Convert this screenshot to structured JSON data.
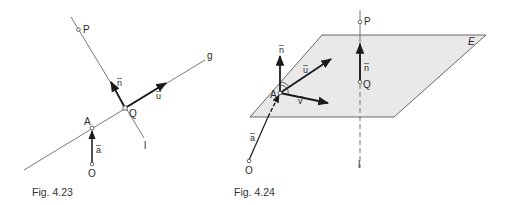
{
  "figures": [
    {
      "caption": "Fig. 4.23",
      "points": {
        "P": "P",
        "Q": "Q",
        "A": "A",
        "O": "O"
      },
      "lines": {
        "g": "g",
        "l": "l"
      },
      "vectors": {
        "n": "n",
        "u": "u",
        "a": "a"
      }
    },
    {
      "caption": "Fig. 4.24",
      "plane": "E",
      "points": {
        "P": "P",
        "Q": "Q",
        "A": "A",
        "O": "O"
      },
      "lines": {
        "l": "l"
      },
      "vectors": {
        "n_at_A": "n",
        "u": "u",
        "v": "v",
        "a": "a",
        "n_at_Q": "n"
      }
    }
  ],
  "colors": {
    "line": "#555555",
    "vector": "#1a1a1a",
    "plane_fill": "#e9e9e9",
    "plane_edge": "#444444",
    "text": "#2a2a2a"
  }
}
